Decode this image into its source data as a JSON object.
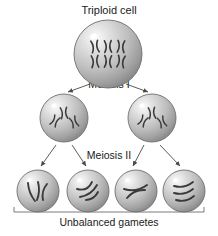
{
  "diagram": {
    "title": "Triploid cell",
    "caption": "Unbalanced gametes",
    "stage_labels": {
      "meiosis_one": "Meiosis I",
      "meiosis_two": "Meiosis II"
    },
    "colors": {
      "text": "#1a1a1a",
      "background": "#ffffff",
      "cell_light": "#f2f2f2",
      "cell_mid": "#b9b9b9",
      "cell_dark": "#8f8f8f",
      "cell_outline": "#6e6e6e",
      "chromosome": "#3a3a3a",
      "arrow": "#4a4a4a",
      "bracket": "#7a7a7a"
    },
    "cells": {
      "parent": {
        "label": "triploid-parent-cell",
        "cx": 108,
        "cy": 54,
        "r": 34,
        "chromosome_count": 6,
        "chromosome_shape": "X-shaped",
        "rows": 2,
        "per_row": 3
      },
      "meiosis_one_products": [
        {
          "label": "daughter-cell-left",
          "cx": 64,
          "cy": 118,
          "r": 24,
          "chromosome_count": 3,
          "chromosome_shape": "X-shaped"
        },
        {
          "label": "daughter-cell-right",
          "cx": 152,
          "cy": 118,
          "r": 24,
          "chromosome_count": 3,
          "chromosome_shape": "X-shaped"
        }
      ],
      "gametes": [
        {
          "label": "gamete-1",
          "cx": 38,
          "cy": 191,
          "r": 21,
          "chromosome_count": 3,
          "chromosome_shape": "single-chromatid"
        },
        {
          "label": "gamete-2",
          "cx": 88,
          "cy": 191,
          "r": 21,
          "chromosome_count": 3,
          "chromosome_shape": "single-chromatid"
        },
        {
          "label": "gamete-3",
          "cx": 136,
          "cy": 191,
          "r": 21,
          "chromosome_count": 2,
          "chromosome_shape": "single-chromatid"
        },
        {
          "label": "gamete-4",
          "cx": 184,
          "cy": 191,
          "r": 21,
          "chromosome_count": 3,
          "chromosome_shape": "single-chromatid"
        }
      ]
    },
    "arrows": {
      "meiosis_one": [
        {
          "name": "arrow-parent-to-left",
          "x1": 90,
          "y1": 84,
          "x2": 68,
          "y2": 92
        },
        {
          "name": "arrow-parent-to-right",
          "x1": 126,
          "y1": 84,
          "x2": 148,
          "y2": 92
        }
      ],
      "meiosis_two": [
        {
          "name": "arrow-left-to-gamete-1",
          "x1": 56,
          "y1": 145,
          "x2": 41,
          "y2": 166
        },
        {
          "name": "arrow-left-to-gamete-2",
          "x1": 72,
          "y1": 145,
          "x2": 86,
          "y2": 166
        },
        {
          "name": "arrow-right-to-gamete-3",
          "x1": 144,
          "y1": 145,
          "x2": 133,
          "y2": 166
        },
        {
          "name": "arrow-right-to-gamete-4",
          "x1": 160,
          "y1": 145,
          "x2": 180,
          "y2": 166
        }
      ]
    },
    "bracket": {
      "name": "unbalanced-gametes-bracket",
      "x_start": 14,
      "x_end": 204,
      "y": 212,
      "tick_height": 5
    }
  }
}
